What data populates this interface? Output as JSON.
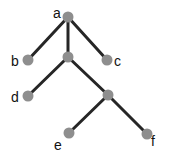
{
  "diagram": {
    "type": "tree",
    "colors": {
      "edge": "#262626",
      "node": "#8e8e8e",
      "label": "#111111"
    },
    "nodes": [
      {
        "id": "a",
        "label": "a",
        "x": 68,
        "y": 17
      },
      {
        "id": "b",
        "label": "b",
        "x": 28,
        "y": 60
      },
      {
        "id": "m",
        "label": "",
        "x": 68,
        "y": 57
      },
      {
        "id": "c",
        "label": "c",
        "x": 107,
        "y": 60
      },
      {
        "id": "d",
        "label": "d",
        "x": 28,
        "y": 96
      },
      {
        "id": "n",
        "label": "",
        "x": 108,
        "y": 95
      },
      {
        "id": "e",
        "label": "e",
        "x": 69,
        "y": 133
      },
      {
        "id": "f",
        "label": "f",
        "x": 147,
        "y": 134
      }
    ],
    "edges": [
      [
        "a",
        "b"
      ],
      [
        "a",
        "m"
      ],
      [
        "a",
        "c"
      ],
      [
        "m",
        "d"
      ],
      [
        "m",
        "n"
      ],
      [
        "n",
        "e"
      ],
      [
        "n",
        "f"
      ]
    ],
    "labels": {
      "a": "a",
      "b": "b",
      "c": "c",
      "d": "d",
      "e": "e",
      "f": "f"
    }
  }
}
